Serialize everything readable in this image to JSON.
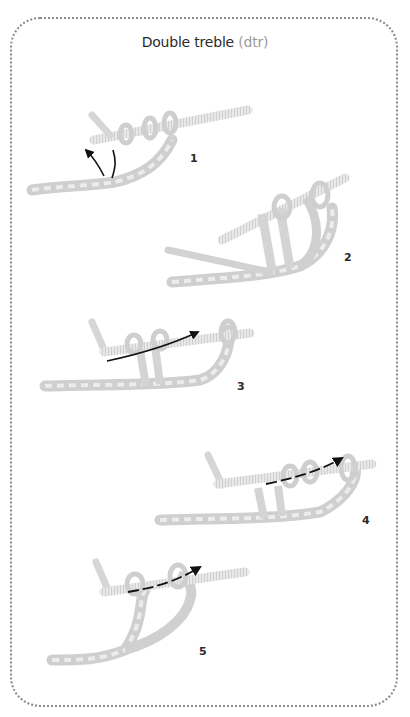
{
  "title": {
    "main": "Double treble",
    "abbreviation": "(dtr)"
  },
  "colors": {
    "border": "#8a8a8a",
    "yarn": "#d6d6d6",
    "yarn_shadow": "#bdbdbd",
    "hook": "#e2e2e2",
    "arrow": "#111111",
    "title_text": "#2a2a2a",
    "abbr_text": "#9a9a9a"
  },
  "steps": [
    {
      "number": "1",
      "arrow": "curved-up-left"
    },
    {
      "number": "2",
      "arrow": "none"
    },
    {
      "number": "3",
      "arrow": "through-loops-right"
    },
    {
      "number": "4",
      "arrow": "through-loops-right-dashed"
    },
    {
      "number": "5",
      "arrow": "through-loops-right-dashed"
    }
  ]
}
